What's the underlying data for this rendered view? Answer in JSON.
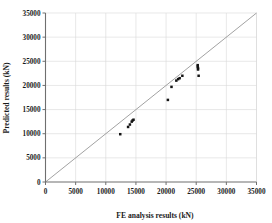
{
  "chart_data": {
    "type": "scatter",
    "title": "",
    "xlabel": "FE analysis results (kN)",
    "ylabel": "Predicted results (kN)",
    "xlim": [
      0,
      35000
    ],
    "ylim": [
      0,
      35000
    ],
    "xticks": [
      0,
      5000,
      10000,
      15000,
      20000,
      25000,
      30000,
      35000
    ],
    "yticks": [
      0,
      5000,
      10000,
      15000,
      20000,
      25000,
      30000,
      35000
    ],
    "xtick_labels": [
      "0",
      "5000",
      "10000",
      "15000",
      "20000",
      "25000",
      "30000",
      "35000"
    ],
    "ytick_labels": [
      "0",
      "5000",
      "10000",
      "15000",
      "20000",
      "25000",
      "30000",
      "35000"
    ],
    "grid": true,
    "legend": null,
    "legend_position": "none",
    "marker": "filled-square",
    "marker_color": "#141414",
    "reference_line": {
      "name": "equality-line",
      "type": "line",
      "from": [
        0,
        0
      ],
      "to": [
        35000,
        35000
      ],
      "color": "#8a8a8a"
    },
    "series": [
      {
        "name": "Predicted vs FE analysis",
        "points": [
          [
            12400,
            9900
          ],
          [
            13700,
            11400
          ],
          [
            14000,
            11900
          ],
          [
            14300,
            12500
          ],
          [
            14450,
            12750
          ],
          [
            14600,
            12900
          ],
          [
            20300,
            17000
          ],
          [
            20900,
            19700
          ],
          [
            21700,
            21000
          ],
          [
            22000,
            21300
          ],
          [
            22250,
            21500
          ],
          [
            22700,
            22000
          ],
          [
            25250,
            24200
          ],
          [
            25250,
            23900
          ],
          [
            25300,
            23600
          ],
          [
            25300,
            23300
          ],
          [
            25400,
            22000
          ]
        ]
      }
    ]
  },
  "axis_titles": {
    "x": "FE analysis results (kN)",
    "y": "Predicted results (kN)"
  }
}
